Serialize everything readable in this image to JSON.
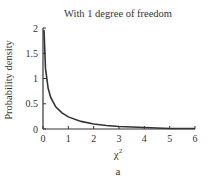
{
  "chart_data": {
    "type": "line",
    "title": "With 1 degree of freedom",
    "xlabel": "χ²",
    "ylabel": "Probability density",
    "panel_label": "a",
    "xlim": [
      0,
      6
    ],
    "ylim": [
      0,
      2
    ],
    "x_ticks": [
      "0",
      "1",
      "2",
      "3",
      "4",
      "5",
      "6"
    ],
    "y_ticks": [
      "0",
      "0.5",
      "1",
      "1.5",
      "2"
    ],
    "grid": false,
    "series": [
      {
        "name": "chi-square pdf, df=1",
        "x": [
          0.04,
          0.1,
          0.2,
          0.3,
          0.5,
          0.75,
          1,
          1.5,
          2,
          2.5,
          3,
          4,
          5,
          6
        ],
        "y": [
          1.96,
          1.2,
          0.81,
          0.63,
          0.44,
          0.32,
          0.24,
          0.15,
          0.1,
          0.07,
          0.05,
          0.03,
          0.01,
          0.01
        ]
      }
    ]
  }
}
